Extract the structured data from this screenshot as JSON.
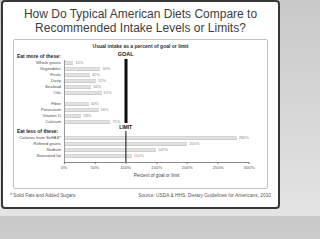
{
  "title": "How Do Typical American Diets Compare to Recommended Intake Levels or Limits?",
  "footnote": "* Solid Fats and Added Sugars",
  "source": "Source: USDA & HHS, Dietary Guidelines for Americans, 2010",
  "chart_data": {
    "type": "bar",
    "orientation": "horizontal",
    "title": "Usual intake as a percent of goal or limit",
    "xlabel": "Percent of goal or limit",
    "xlim": [
      0,
      300
    ],
    "x_ticks": [
      "0%",
      "50%",
      "100%",
      "150%",
      "200%",
      "250%",
      "300%"
    ],
    "x_tick_values": [
      0,
      50,
      100,
      150,
      200,
      250,
      300
    ],
    "grid": false,
    "goal_label": "GOAL",
    "limit_label": "LIMIT",
    "reference_value": 100,
    "bar_color": "#c9c9c7",
    "reference_line_color": "#0d0d0d",
    "groups": [
      {
        "label": "Eat more of these:",
        "subgroups": [
          {
            "items": [
              {
                "label": "Whole grains",
                "value": 15,
                "display": "15%"
              },
              {
                "label": "Vegetables",
                "value": 59,
                "display": "59%"
              },
              {
                "label": "Fruits",
                "value": 42,
                "display": "42%"
              },
              {
                "label": "Dairy",
                "value": 52,
                "display": "52%"
              },
              {
                "label": "Seafood",
                "value": 44,
                "display": "44%"
              },
              {
                "label": "Oils",
                "value": 61,
                "display": "61%"
              }
            ]
          },
          {
            "items": [
              {
                "label": "Fiber",
                "value": 40,
                "display": "40%"
              },
              {
                "label": "Potassium",
                "value": 56,
                "display": "56%"
              },
              {
                "label": "Vitamin D",
                "value": 28,
                "display": "28%"
              },
              {
                "label": "Calcium",
                "value": 75,
                "display": "75%"
              }
            ]
          }
        ]
      },
      {
        "label": "Eat less of these:",
        "subgroups": [
          {
            "items": [
              {
                "label": "Calories from SoFAS*",
                "value": 280,
                "display": "280%"
              },
              {
                "label": "Refined grains",
                "value": 200,
                "display": "200%"
              },
              {
                "label": "Sodium",
                "value": 149,
                "display": "149%"
              },
              {
                "label": "Saturated fat",
                "value": 110,
                "display": "110%"
              }
            ]
          }
        ]
      }
    ]
  }
}
